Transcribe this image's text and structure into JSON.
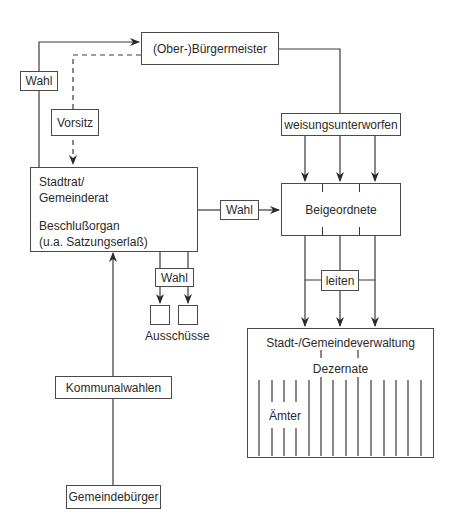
{
  "diagram": {
    "nodes": {
      "buergermeister": "(Ober-)Bürgermeister",
      "stadtrat_line1": "Stadtrat/",
      "stadtrat_line2": "Gemeinderat",
      "stadtrat_line3": "Beschlußorgan",
      "stadtrat_line4": "(u.a. Satzungserlaß)",
      "beigeordnete": "Beigeordnete",
      "verwaltung": "Stadt-/Gemeindeverwaltung",
      "dezernate": "Dezernate",
      "aemter": "Ämter",
      "ausschuesse": "Ausschüsse",
      "kommunalwahlen": "Kommunalwahlen",
      "gemeindebuerger": "Gemeindebürger"
    },
    "edge_labels": {
      "wahl_bm": "Wahl",
      "vorsitz": "Vorsitz",
      "weisungsunterworfen": "weisungsunterworfen",
      "wahl_beigeordnete": "Wahl",
      "wahl_ausschuesse": "Wahl",
      "leiten": "leiten"
    },
    "colors": {
      "line": "#3a3a3a",
      "text": "#2a2a2a",
      "background": "#ffffff"
    }
  }
}
